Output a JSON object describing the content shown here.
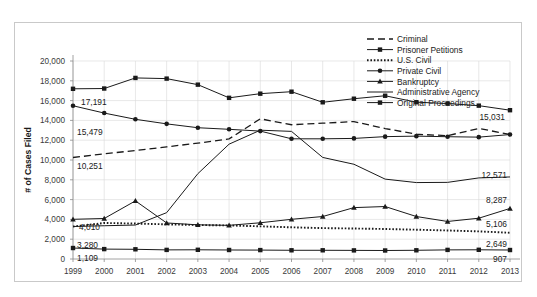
{
  "chart_data": {
    "type": "line",
    "title": "",
    "xlabel": "",
    "ylabel": "# of Cases Filed",
    "ylim": [
      0,
      20000
    ],
    "ytick_step": 2000,
    "grid": true,
    "legend_position": "top-right",
    "categories": [
      "1999",
      "2000",
      "2001",
      "2002",
      "2003",
      "2004",
      "2005",
      "2006",
      "2007",
      "2008",
      "2009",
      "2010",
      "2011",
      "2012",
      "2013"
    ],
    "yticks": [
      "0",
      "2,000",
      "4,000",
      "6,000",
      "8,000",
      "10,000",
      "12,000",
      "14,000",
      "16,000",
      "18,000",
      "20,000"
    ],
    "series": [
      {
        "name": "Criminal",
        "style": "dashed",
        "marker": "none",
        "values": [
          10251,
          10620,
          10960,
          11330,
          11700,
          12130,
          14160,
          13560,
          13720,
          13880,
          13180,
          12600,
          12460,
          13190,
          12571
        ]
      },
      {
        "name": "Prisoner Petitions",
        "style": "solid",
        "marker": "square",
        "values": [
          17191,
          17220,
          18290,
          18220,
          17610,
          16280,
          16700,
          16900,
          15830,
          16190,
          16490,
          15840,
          15700,
          15490,
          15031
        ]
      },
      {
        "name": "U.S. Civil",
        "style": "dotted",
        "marker": "none",
        "values": [
          3280,
          3640,
          3580,
          3500,
          3430,
          3390,
          3300,
          3200,
          3120,
          3080,
          3030,
          2960,
          2880,
          2790,
          2649
        ]
      },
      {
        "name": "Private Civil",
        "style": "solid",
        "marker": "circle",
        "values": [
          15479,
          14740,
          14110,
          13650,
          13260,
          13100,
          12920,
          12140,
          12140,
          12180,
          12360,
          12410,
          12350,
          12310,
          12571
        ]
      },
      {
        "name": "Bankruptcy",
        "style": "solid",
        "marker": "triangle",
        "values": [
          4010,
          4090,
          5870,
          3640,
          3450,
          3400,
          3660,
          4010,
          4290,
          5190,
          5300,
          4290,
          3790,
          4120,
          5106
        ]
      },
      {
        "name": "Administrative Agency",
        "style": "solid",
        "marker": "none",
        "values": [
          3280,
          3360,
          3430,
          4680,
          8620,
          11600,
          13010,
          12890,
          10260,
          9570,
          8070,
          7720,
          7740,
          8190,
          8287
        ]
      },
      {
        "name": "Original Proceedings",
        "style": "solid",
        "marker": "square",
        "values": [
          1109,
          1000,
          980,
          920,
          930,
          910,
          900,
          880,
          880,
          870,
          860,
          880,
          920,
          930,
          907
        ]
      }
    ],
    "annotations": [
      {
        "text": "17,191",
        "series": "Prisoner Petitions",
        "side": "left"
      },
      {
        "text": "15,479",
        "series": "Private Civil",
        "side": "left"
      },
      {
        "text": "10,251",
        "series": "Criminal",
        "side": "left"
      },
      {
        "text": "4,010",
        "series": "Bankruptcy",
        "side": "left"
      },
      {
        "text": "3,280",
        "series": "U.S. Civil",
        "side": "left"
      },
      {
        "text": "1,109",
        "series": "Original Proceedings",
        "side": "left"
      },
      {
        "text": "15,031",
        "series": "Prisoner Petitions",
        "side": "right"
      },
      {
        "text": "12,571",
        "series": "Private Civil",
        "side": "right"
      },
      {
        "text": "8,287",
        "series": "Administrative Agency",
        "side": "right"
      },
      {
        "text": "5,106",
        "series": "Bankruptcy",
        "side": "right"
      },
      {
        "text": "2,649",
        "series": "U.S. Civil",
        "side": "right"
      },
      {
        "text": "907",
        "series": "Original Proceedings",
        "side": "right"
      }
    ],
    "colors": {
      "line": "#1a1a1a",
      "grid": "#d8d8d8",
      "axis": "#8a8a8a",
      "background": "#ffffff",
      "border": "#c9c9c9"
    }
  }
}
